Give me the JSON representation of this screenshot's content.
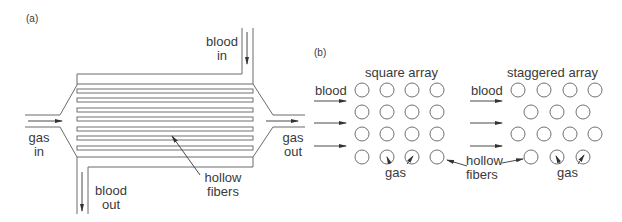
{
  "panel_a": {
    "label": "(a)",
    "blood_in": {
      "line1": "blood",
      "line2": "in"
    },
    "blood_out": {
      "line1": "blood",
      "line2": "out"
    },
    "gas_in": {
      "line1": "gas",
      "line2": "in"
    },
    "gas_out": {
      "line1": "gas",
      "line2": "out"
    },
    "hollow_fibers": {
      "line1": "hollow",
      "line2": "fibers"
    },
    "fiber_count": 7
  },
  "panel_b": {
    "label": "(b)",
    "square_array": {
      "title": "square array",
      "blood_label": "blood",
      "gas_label": "gas",
      "hollow_fibers": {
        "line1": "hollow",
        "line2": "fibers"
      },
      "rows": [
        4,
        4,
        4,
        4
      ]
    },
    "staggered_array": {
      "title": "staggered array",
      "blood_label": "blood",
      "gas_label": "gas",
      "rows": [
        4,
        3,
        4,
        3
      ]
    }
  },
  "colors": {
    "line": "#6a6a6a",
    "text": "#3a3a3a",
    "background": "#ffffff"
  }
}
